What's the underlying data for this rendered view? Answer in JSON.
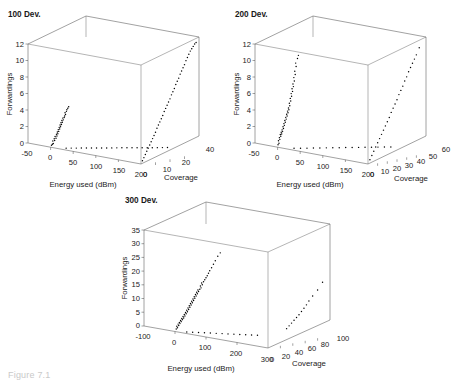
{
  "figure": {
    "caption": "Figure 7.1",
    "background": "#ffffff",
    "point_color": "#000000",
    "axis_color": "#555555"
  },
  "chart_data": [
    {
      "type": "scatter",
      "title": "100 Dev.",
      "xlabel": "Energy used (dBm)",
      "ylabel": "Coverage",
      "zlabel": "Forwardings",
      "xlim": [
        -50,
        200
      ],
      "ylim": [
        0,
        40
      ],
      "zlim": [
        0,
        12
      ],
      "xticks": [
        "-50",
        "0",
        "50",
        "100",
        "150",
        "200"
      ],
      "yticks": [
        "0",
        "10",
        "20",
        "40"
      ],
      "zticks": [
        "0",
        "2",
        "4",
        "6",
        "8",
        "10",
        "12"
      ],
      "grid": true,
      "legend": "none",
      "series": [
        {
          "name": "energy-vs-forwardings",
          "plane": "xz",
          "points": [
            [
              2,
              0.25
            ],
            [
              4,
              0.4
            ],
            [
              6,
              0.5
            ],
            [
              5,
              0.8
            ],
            [
              9,
              0.9
            ],
            [
              8,
              1.1
            ],
            [
              12,
              1.2
            ],
            [
              10,
              1.4
            ],
            [
              14,
              1.5
            ],
            [
              13,
              1.7
            ],
            [
              16,
              1.8
            ],
            [
              15,
              2.0
            ],
            [
              18,
              2.1
            ],
            [
              17,
              2.3
            ],
            [
              20,
              2.4
            ],
            [
              19,
              2.6
            ],
            [
              22,
              2.7
            ],
            [
              21,
              2.9
            ],
            [
              24,
              3.0
            ],
            [
              23,
              3.2
            ],
            [
              26,
              3.3
            ],
            [
              25,
              3.5
            ],
            [
              28,
              3.6
            ],
            [
              27,
              3.8
            ],
            [
              30,
              3.9
            ],
            [
              31,
              4.1
            ],
            [
              33,
              4.3
            ],
            [
              32,
              4.5
            ],
            [
              35,
              4.7
            ],
            [
              36,
              4.9
            ],
            [
              38,
              5.1
            ],
            [
              40,
              5.3
            ]
          ]
        },
        {
          "name": "coverage-vs-forwardings",
          "plane": "yz",
          "points": [
            [
              1,
              0.3
            ],
            [
              2,
              0.6
            ],
            [
              3,
              0.9
            ],
            [
              4,
              1.2
            ],
            [
              5,
              1.5
            ],
            [
              6,
              1.8
            ],
            [
              7,
              2.1
            ],
            [
              8,
              2.4
            ],
            [
              9,
              2.7
            ],
            [
              10,
              3.0
            ],
            [
              11,
              3.4
            ],
            [
              12,
              3.7
            ],
            [
              13,
              4.0
            ],
            [
              14,
              4.3
            ],
            [
              15,
              4.6
            ],
            [
              16,
              5.0
            ],
            [
              17,
              5.3
            ],
            [
              18,
              5.6
            ],
            [
              19,
              5.9
            ],
            [
              20,
              6.2
            ],
            [
              21,
              6.6
            ],
            [
              22,
              6.9
            ],
            [
              23,
              7.2
            ],
            [
              24,
              7.6
            ],
            [
              25,
              7.9
            ],
            [
              26,
              8.2
            ],
            [
              27,
              8.6
            ],
            [
              28,
              8.9
            ],
            [
              29,
              9.2
            ],
            [
              30,
              9.5
            ],
            [
              31,
              9.9
            ],
            [
              32,
              10.2
            ],
            [
              33,
              10.5
            ],
            [
              34,
              10.8
            ],
            [
              35,
              11.0
            ],
            [
              36,
              11.2
            ],
            [
              37,
              11.4
            ],
            [
              38,
              11.5
            ]
          ]
        },
        {
          "name": "floor-projection",
          "plane": "xy",
          "points": [
            [
              28,
              2
            ],
            [
              36,
              3
            ],
            [
              44,
              4
            ],
            [
              52,
              5
            ],
            [
              60,
              6
            ],
            [
              68,
              7
            ],
            [
              76,
              8
            ],
            [
              84,
              9
            ],
            [
              92,
              10
            ],
            [
              100,
              11
            ],
            [
              108,
              12
            ],
            [
              116,
              13
            ],
            [
              124,
              14
            ],
            [
              132,
              15
            ],
            [
              140,
              16
            ],
            [
              148,
              17
            ],
            [
              156,
              18
            ],
            [
              164,
              19
            ],
            [
              172,
              20
            ],
            [
              180,
              21
            ],
            [
              188,
              22
            ]
          ]
        }
      ]
    },
    {
      "type": "scatter",
      "title": "200 Dev.",
      "xlabel": "Energy used (dBm)",
      "ylabel": "Coverage",
      "zlabel": "Forwardings",
      "xlim": [
        -50,
        200
      ],
      "ylim": [
        0,
        60
      ],
      "zlim": [
        0,
        12
      ],
      "xticks": [
        "-50",
        "0",
        "50",
        "100",
        "150",
        "200"
      ],
      "yticks": [
        "0",
        "10",
        "20",
        "30",
        "40",
        "50",
        "60"
      ],
      "zticks": [
        "0",
        "2",
        "4",
        "6",
        "8",
        "10",
        "12"
      ],
      "grid": true,
      "legend": "none",
      "series": [
        {
          "name": "energy-vs-forwardings",
          "plane": "xz",
          "points": [
            [
              1,
              0.3
            ],
            [
              3,
              0.5
            ],
            [
              2,
              0.8
            ],
            [
              5,
              1.0
            ],
            [
              4,
              1.2
            ],
            [
              7,
              1.4
            ],
            [
              6,
              1.6
            ],
            [
              9,
              1.7
            ],
            [
              8,
              1.9
            ],
            [
              11,
              2.0
            ],
            [
              10,
              2.2
            ],
            [
              13,
              2.4
            ],
            [
              12,
              2.6
            ],
            [
              15,
              2.8
            ],
            [
              14,
              3.0
            ],
            [
              17,
              3.2
            ],
            [
              16,
              3.4
            ],
            [
              19,
              3.6
            ],
            [
              18,
              3.8
            ],
            [
              21,
              4.0
            ],
            [
              20,
              4.2
            ],
            [
              23,
              4.4
            ],
            [
              22,
              4.6
            ],
            [
              25,
              4.8
            ],
            [
              24,
              5.0
            ],
            [
              27,
              5.3
            ],
            [
              26,
              5.6
            ],
            [
              29,
              5.9
            ],
            [
              28,
              6.2
            ],
            [
              31,
              6.5
            ],
            [
              30,
              6.8
            ],
            [
              33,
              7.1
            ],
            [
              32,
              7.4
            ],
            [
              35,
              7.7
            ],
            [
              34,
              8.0
            ],
            [
              37,
              8.4
            ],
            [
              36,
              8.8
            ],
            [
              39,
              9.2
            ],
            [
              38,
              9.6
            ],
            [
              41,
              10.2
            ],
            [
              40,
              10.6
            ],
            [
              44,
              11.2
            ],
            [
              46,
              11.6
            ]
          ]
        },
        {
          "name": "coverage-vs-forwardings",
          "plane": "yz",
          "points": [
            [
              2,
              0.4
            ],
            [
              4,
              0.8
            ],
            [
              6,
              1.2
            ],
            [
              8,
              1.6
            ],
            [
              10,
              2.0
            ],
            [
              12,
              2.4
            ],
            [
              14,
              2.8
            ],
            [
              16,
              3.2
            ],
            [
              18,
              3.6
            ],
            [
              20,
              4.0
            ],
            [
              22,
              4.4
            ],
            [
              24,
              4.9
            ],
            [
              26,
              5.3
            ],
            [
              28,
              5.7
            ],
            [
              30,
              6.1
            ],
            [
              32,
              6.6
            ],
            [
              34,
              7.0
            ],
            [
              36,
              7.4
            ],
            [
              38,
              7.9
            ],
            [
              40,
              8.3
            ],
            [
              42,
              8.8
            ],
            [
              44,
              9.2
            ],
            [
              46,
              9.6
            ],
            [
              48,
              10.0
            ],
            [
              50,
              10.4
            ],
            [
              53,
              11.1
            ]
          ]
        },
        {
          "name": "floor-projection",
          "plane": "xy",
          "points": [
            [
              30,
              3
            ],
            [
              40,
              5
            ],
            [
              50,
              7
            ],
            [
              60,
              9
            ],
            [
              70,
              11
            ],
            [
              80,
              13
            ],
            [
              90,
              15
            ],
            [
              100,
              17
            ],
            [
              110,
              19
            ],
            [
              120,
              21
            ],
            [
              130,
              23
            ],
            [
              140,
              25
            ],
            [
              150,
              27
            ],
            [
              160,
              29
            ],
            [
              170,
              31
            ],
            [
              180,
              33
            ]
          ]
        }
      ]
    },
    {
      "type": "scatter",
      "title": "300 Dev.",
      "xlabel": "Energy used (dBm)",
      "ylabel": "Coverage",
      "zlabel": "Forwardings",
      "xlim": [
        -100,
        300
      ],
      "ylim": [
        0,
        100
      ],
      "zlim": [
        0,
        35
      ],
      "xticks": [
        "-100",
        "0",
        "100",
        "200",
        "300"
      ],
      "yticks": [
        "0",
        "20",
        "40",
        "60",
        "80",
        "100"
      ],
      "zticks": [
        "0",
        "5",
        "10",
        "15",
        "20",
        "25",
        "30",
        "35"
      ],
      "grid": true,
      "legend": "none",
      "series": [
        {
          "name": "energy-vs-forwardings",
          "plane": "xz",
          "points": [
            [
              4,
              1.0
            ],
            [
              8,
              1.5
            ],
            [
              6,
              2.0
            ],
            [
              12,
              2.4
            ],
            [
              10,
              2.9
            ],
            [
              16,
              3.2
            ],
            [
              14,
              3.6
            ],
            [
              20,
              4.0
            ],
            [
              18,
              4.4
            ],
            [
              24,
              4.8
            ],
            [
              22,
              5.2
            ],
            [
              28,
              5.5
            ],
            [
              26,
              6.0
            ],
            [
              32,
              6.3
            ],
            [
              30,
              6.8
            ],
            [
              36,
              7.2
            ],
            [
              34,
              7.6
            ],
            [
              40,
              8.0
            ],
            [
              38,
              8.5
            ],
            [
              44,
              8.9
            ],
            [
              42,
              9.4
            ],
            [
              48,
              9.8
            ],
            [
              46,
              10.3
            ],
            [
              52,
              10.7
            ],
            [
              50,
              11.2
            ],
            [
              56,
              11.6
            ],
            [
              54,
              12.1
            ],
            [
              60,
              12.5
            ],
            [
              58,
              13.0
            ],
            [
              64,
              13.4
            ],
            [
              62,
              13.9
            ],
            [
              68,
              14.3
            ],
            [
              66,
              14.8
            ],
            [
              72,
              15.2
            ],
            [
              70,
              15.7
            ],
            [
              76,
              16.1
            ],
            [
              74,
              16.6
            ],
            [
              80,
              17.0
            ],
            [
              84,
              17.6
            ],
            [
              82,
              18.2
            ],
            [
              88,
              18.8
            ],
            [
              86,
              19.4
            ],
            [
              92,
              20.0
            ],
            [
              96,
              20.8
            ],
            [
              100,
              21.6
            ],
            [
              104,
              22.4
            ],
            [
              108,
              23.4
            ],
            [
              112,
              24.4
            ],
            [
              118,
              25.6
            ],
            [
              124,
              27.0
            ],
            [
              130,
              28.4
            ],
            [
              138,
              30.2
            ],
            [
              146,
              31.6
            ]
          ]
        },
        {
          "name": "coverage-vs-forwardings",
          "plane": "yz",
          "points": [
            [
              30,
              4.0
            ],
            [
              34,
              4.6
            ],
            [
              38,
              5.2
            ],
            [
              42,
              5.8
            ],
            [
              46,
              6.4
            ],
            [
              50,
              7.0
            ],
            [
              54,
              7.8
            ],
            [
              58,
              8.6
            ],
            [
              62,
              9.4
            ],
            [
              66,
              10.4
            ],
            [
              72,
              11.6
            ],
            [
              80,
              13.0
            ],
            [
              88,
              15.0
            ]
          ]
        },
        {
          "name": "floor-projection",
          "plane": "xy",
          "points": [
            [
              30,
              4
            ],
            [
              45,
              6
            ],
            [
              60,
              8
            ],
            [
              75,
              10
            ],
            [
              90,
              12
            ],
            [
              105,
              14
            ],
            [
              120,
              16
            ],
            [
              135,
              18
            ],
            [
              150,
              20
            ],
            [
              165,
              22
            ],
            [
              180,
              24
            ],
            [
              195,
              26
            ],
            [
              210,
              28
            ]
          ]
        }
      ]
    }
  ]
}
